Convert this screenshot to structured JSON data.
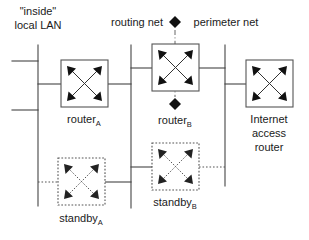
{
  "diagram": {
    "canvas": {
      "width": 309,
      "height": 240,
      "background": "#ffffff"
    },
    "colors": {
      "line": "#444444",
      "box_stroke": "#555555",
      "text": "#1a1a1a",
      "marker": "#111111",
      "background": "#ffffff"
    },
    "network_labels": {
      "inside_line1": "\"inside\"",
      "inside_line2": "local LAN",
      "routing_net": "routing net",
      "perimeter_net": "perimeter net",
      "separator_marker": "diamond"
    },
    "nodes": [
      {
        "id": "router-a",
        "label_base": "router",
        "label_sub": "A",
        "style": "solid",
        "icon": "router-icon",
        "x": 61,
        "y": 60,
        "w": 47,
        "h": 47
      },
      {
        "id": "router-b",
        "label_base": "router",
        "label_sub": "B",
        "style": "solid",
        "icon": "router-icon",
        "x": 152,
        "y": 44,
        "w": 47,
        "h": 47
      },
      {
        "id": "internet-access-router",
        "label_line1": "Internet",
        "label_line2": "access",
        "label_line3": "router",
        "style": "solid",
        "icon": "router-icon",
        "x": 246,
        "y": 60,
        "w": 47,
        "h": 47
      },
      {
        "id": "standby-a",
        "label_base": "standby",
        "label_sub": "A",
        "style": "dotted",
        "icon": "router-standby-icon",
        "x": 58,
        "y": 158,
        "w": 47,
        "h": 47
      },
      {
        "id": "standby-b",
        "label_base": "standby",
        "label_sub": "B",
        "style": "dotted",
        "icon": "router-standby-icon",
        "x": 152,
        "y": 143,
        "w": 47,
        "h": 47
      }
    ],
    "buses": [
      {
        "id": "inside-lan-bus",
        "x": 38,
        "y1": 45,
        "y2": 206,
        "style": "solid"
      },
      {
        "id": "routing-net-bus",
        "x": 131,
        "y1": 45,
        "y2": 208,
        "style": "solid"
      },
      {
        "id": "perimeter-net-bus",
        "x": 225,
        "y1": 45,
        "y2": 186,
        "style": "solid"
      }
    ],
    "markers": [
      {
        "id": "perimeter-marker-top",
        "x": 175,
        "y": 22
      },
      {
        "id": "perimeter-marker-bottom",
        "x": 175,
        "y": 104
      }
    ],
    "divider": {
      "id": "perimeter-divider",
      "x": 175,
      "y1": 30,
      "y2": 97
    }
  }
}
